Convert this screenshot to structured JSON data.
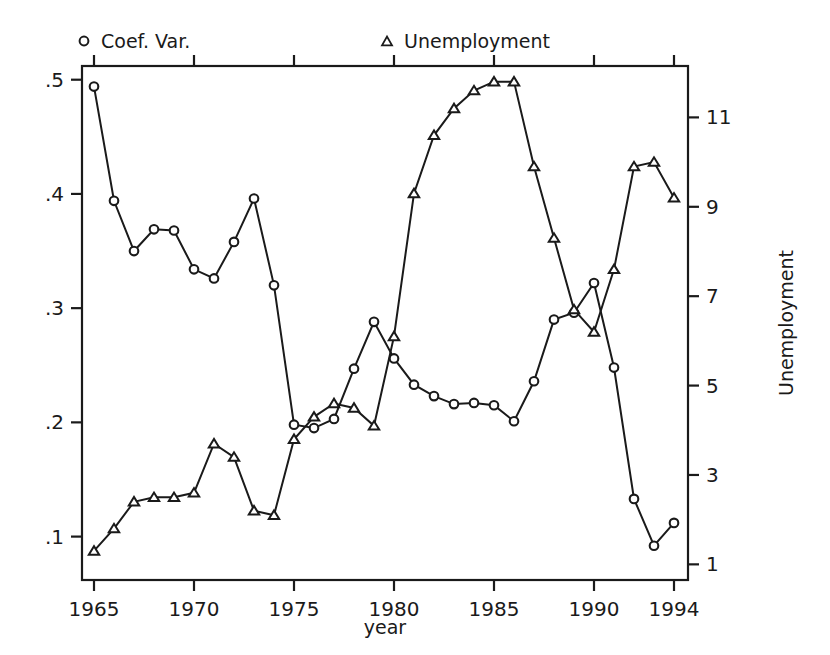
{
  "figure": {
    "background": "#ffffff",
    "ink": "#1a1a1a"
  },
  "legend": {
    "position": "top",
    "entries": [
      {
        "label": "Coef. Var.",
        "marker": "circle-marker",
        "axis": "left"
      },
      {
        "label": "Unemployment",
        "marker": "triangle-marker",
        "axis": "right"
      }
    ]
  },
  "axes": {
    "x": {
      "label": "year",
      "ticks": [
        "1965",
        "1970",
        "1975",
        "1980",
        "1985",
        "1990",
        "1994"
      ],
      "tick_values": [
        1965,
        1970,
        1975,
        1980,
        1985,
        1990,
        1994
      ],
      "range": [
        1964.4,
        1994.7
      ]
    },
    "y_left": {
      "label": "",
      "ticks": [
        ".5",
        ".4",
        ".3",
        ".2",
        ".1"
      ],
      "tick_values": [
        0.5,
        0.4,
        0.3,
        0.2,
        0.1
      ],
      "range": [
        0.062,
        0.512
      ]
    },
    "y_right": {
      "label": "Unemployment",
      "ticks": [
        "11",
        "9",
        "7",
        "5",
        "3",
        "1"
      ],
      "tick_values": [
        11,
        9,
        7,
        5,
        3,
        1
      ],
      "range": [
        0.65,
        12.15
      ]
    }
  },
  "chart_data": {
    "type": "line",
    "title": "",
    "xlabel": "year",
    "ylabel": "",
    "y2label": "Unemployment",
    "grid": false,
    "legend_position": "top",
    "xlim": [
      1964.4,
      1994.7
    ],
    "ylim": [
      0.062,
      0.512
    ],
    "y2lim": [
      0.65,
      12.15
    ],
    "x": [
      1965,
      1966,
      1967,
      1968,
      1969,
      1970,
      1971,
      1972,
      1973,
      1974,
      1975,
      1976,
      1977,
      1978,
      1979,
      1980,
      1981,
      1982,
      1983,
      1984,
      1985,
      1986,
      1987,
      1988,
      1989,
      1990,
      1991,
      1992,
      1993,
      1994
    ],
    "series": [
      {
        "name": "Coef. Var.",
        "axis": "left",
        "marker": "circle",
        "values": [
          0.494,
          0.394,
          0.35,
          0.369,
          0.368,
          0.334,
          0.326,
          0.358,
          0.396,
          0.32,
          0.198,
          0.195,
          0.203,
          0.247,
          0.288,
          0.256,
          0.233,
          0.223,
          0.216,
          0.217,
          0.215,
          0.201,
          0.236,
          0.29,
          0.296,
          0.322,
          0.248,
          0.133,
          0.092,
          0.112
        ]
      },
      {
        "name": "Unemployment",
        "axis": "right",
        "marker": "triangle",
        "values": [
          1.3,
          1.8,
          2.4,
          2.5,
          2.5,
          2.6,
          3.7,
          3.4,
          2.2,
          2.1,
          3.8,
          4.3,
          4.6,
          4.5,
          4.1,
          6.1,
          9.3,
          10.6,
          11.2,
          11.6,
          11.8,
          11.8,
          9.9,
          8.3,
          6.7,
          6.2,
          7.6,
          9.9,
          10.0,
          9.2
        ]
      }
    ]
  }
}
